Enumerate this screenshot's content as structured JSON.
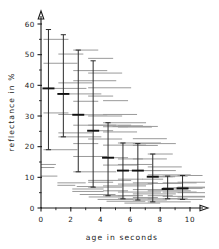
{
  "chart_data": {
    "type": "scatter",
    "title": "",
    "xlabel": "age in seconds",
    "ylabel": "reflectance in %",
    "xlim": [
      0,
      10.4
    ],
    "ylim": [
      0,
      62
    ],
    "grid": false,
    "legend": null,
    "xticks_major": [
      0,
      2,
      4,
      6,
      8,
      10
    ],
    "xticks_minor": [
      1,
      3,
      5,
      7,
      9
    ],
    "yticks_major": [
      0,
      10,
      20,
      30,
      40,
      50,
      60
    ],
    "yticks_minor": [
      5,
      15,
      25,
      35,
      45,
      55
    ],
    "xtick_labels": [
      "0",
      "2",
      "4",
      "6",
      "8",
      "10"
    ],
    "ytick_labels": [
      "0",
      "10",
      "20",
      "30",
      "40",
      "50",
      "60"
    ],
    "series": [
      {
        "name": "age 0.5 s",
        "x": 0.5,
        "min": 19.0,
        "max": 58.2,
        "median": 39.0,
        "points": [
          55.0,
          47.2,
          39.0,
          31.0,
          19.0
        ]
      },
      {
        "name": "age 1.5 s",
        "x": 1.5,
        "min": 23.2,
        "max": 56.5,
        "median": 37.2,
        "points": [
          50.2,
          40.8,
          37.2,
          30.5,
          24.5,
          23.2
        ]
      },
      {
        "name": "age 2.5 s",
        "x": 2.5,
        "min": 11.8,
        "max": 51.5,
        "median": 30.4,
        "points": [
          51.5,
          44.8,
          41.5,
          34.8,
          30.4,
          27.0,
          21.0,
          16.8,
          11.8
        ]
      },
      {
        "name": "age 3.5 s",
        "x": 3.5,
        "min": 6.8,
        "max": 48.0,
        "median": 25.2,
        "points": [
          48.8,
          44.0,
          39.2,
          36.5,
          30.0,
          27.0,
          25.2,
          22.5,
          9.0,
          8.4,
          6.8
        ]
      },
      {
        "name": "age 4.5 s",
        "x": 4.5,
        "min": 4.0,
        "max": 27.8,
        "median": 16.4,
        "points": [
          35.0,
          30.5,
          27.8,
          26.5,
          24.8,
          20.5,
          16.4,
          14.0,
          7.2,
          5.6,
          4.0
        ]
      },
      {
        "name": "age 5.5 s",
        "x": 5.5,
        "min": 3.0,
        "max": 21.2,
        "median": 12.2,
        "points": [
          26.8,
          26.4,
          21.2,
          16.0,
          14.2,
          12.2,
          9.4,
          7.8,
          5.2,
          4.0,
          3.0
        ]
      },
      {
        "name": "age 6.5 s",
        "x": 6.5,
        "min": 2.6,
        "max": 21.0,
        "median": 12.2,
        "points": [
          26.6,
          22.6,
          21.0,
          20.4,
          16.0,
          12.2,
          8.2,
          6.0,
          4.6,
          3.4,
          2.6
        ]
      },
      {
        "name": "age 7.5 s",
        "x": 7.5,
        "min": 2.0,
        "max": 17.6,
        "median": 10.2,
        "points": [
          17.6,
          13.4,
          10.8,
          10.2,
          8.0,
          5.6,
          4.0,
          3.0,
          2.0
        ]
      },
      {
        "name": "age 8.5 s",
        "x": 8.5,
        "min": 3.0,
        "max": 10.4,
        "median": 6.2,
        "points": [
          10.4,
          8.2,
          6.6,
          6.2,
          5.2,
          3.8,
          3.0
        ]
      },
      {
        "name": "age 9.5 s",
        "x": 9.5,
        "min": 2.8,
        "max": 10.6,
        "median": 6.4,
        "points": [
          10.6,
          8.4,
          6.8,
          6.4,
          5.0,
          3.6,
          2.8
        ]
      }
    ],
    "loose_dashes": [
      {
        "y": 14.2,
        "x0": 0.0,
        "x1": 1.0
      },
      {
        "y": 13.2,
        "x0": 0.0,
        "x1": 0.9
      },
      {
        "y": 10.4,
        "x0": 0.0,
        "x1": 1.1
      },
      {
        "y": 8.2,
        "x0": 1.1,
        "x1": 3.0
      },
      {
        "y": 7.4,
        "x0": 1.1,
        "x1": 2.3
      },
      {
        "y": 7.0,
        "x0": 2.4,
        "x1": 3.6
      },
      {
        "y": 6.2,
        "x0": 2.1,
        "x1": 4.2
      },
      {
        "y": 5.4,
        "x0": 2.1,
        "x1": 4.2
      },
      {
        "y": 4.4,
        "x0": 2.6,
        "x1": 5.0
      },
      {
        "y": 3.6,
        "x0": 3.2,
        "x1": 5.6
      },
      {
        "y": 2.8,
        "x0": 3.8,
        "x1": 6.2
      },
      {
        "y": 2.2,
        "x0": 4.4,
        "x1": 7.0
      },
      {
        "y": 1.6,
        "x0": 5.6,
        "x1": 8.0
      },
      {
        "y": 26.6,
        "x0": 4.8,
        "x1": 7.4
      },
      {
        "y": 10.2,
        "x0": 7.6,
        "x1": 9.0
      },
      {
        "y": 9.4,
        "x0": 6.8,
        "x1": 8.2
      }
    ]
  },
  "labels": {
    "x_axis_title": "age in seconds",
    "y_axis_title": "reflectance in %"
  }
}
